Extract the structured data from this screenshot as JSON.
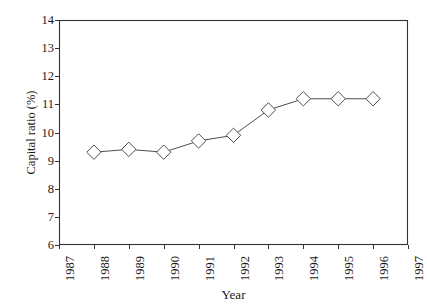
{
  "chart_data": {
    "type": "line",
    "title": "",
    "xlabel": "Year",
    "ylabel": "Capital ratio (%)",
    "x": [
      1988,
      1989,
      1990,
      1991,
      1992,
      1993,
      1994,
      1995,
      1996
    ],
    "values": [
      9.3,
      9.4,
      9.3,
      9.7,
      9.9,
      10.8,
      11.2,
      11.2,
      11.2
    ],
    "series": [
      {
        "name": "Capital ratio",
        "values": [
          9.3,
          9.4,
          9.3,
          9.7,
          9.9,
          10.8,
          11.2,
          11.2,
          11.2
        ],
        "marker": "diamond-open",
        "line_color": "#4d4d4d",
        "marker_color": "#4d4d4d"
      }
    ],
    "xlim": [
      1987,
      1997
    ],
    "ylim": [
      6,
      14
    ],
    "xticks": [
      1987,
      1988,
      1989,
      1990,
      1991,
      1992,
      1993,
      1994,
      1995,
      1996,
      1997
    ],
    "xtick_labels": [
      "1987",
      "1988",
      "1989",
      "1990",
      "1991",
      "1992",
      "1993",
      "1994",
      "1995",
      "1996",
      "1997"
    ],
    "xtick_rotation": 90,
    "yticks": [
      6,
      7,
      8,
      9,
      10,
      11,
      12,
      13,
      14
    ],
    "ytick_labels": [
      "6",
      "7",
      "8",
      "9",
      "10",
      "11",
      "12",
      "13",
      "14"
    ],
    "grid": false,
    "legend": null,
    "legend_position": "none",
    "frame": "full-box",
    "background_color": "#ffffff",
    "axis_color": "#333333"
  }
}
